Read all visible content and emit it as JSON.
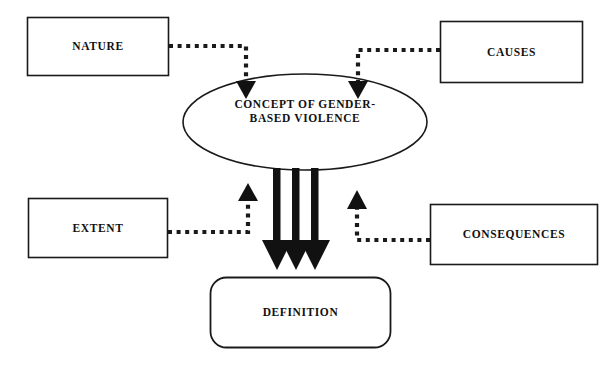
{
  "diagram": {
    "background_color": "#ffffff",
    "line_color": "#1a1a1a",
    "fill_color": "#ffffff",
    "nodes": [
      {
        "id": "nature",
        "label": "NATURE",
        "shape": "rectangle",
        "position": "top-left"
      },
      {
        "id": "causes",
        "label": "CAUSES",
        "shape": "rectangle",
        "position": "top-right"
      },
      {
        "id": "concept",
        "label": "CONCEPT OF GENDER-BASED VIOLENCE",
        "label_line_1": "CONCEPT OF GENDER-",
        "label_line_2": "BASED VIOLENCE",
        "shape": "ellipse",
        "position": "center"
      },
      {
        "id": "extent",
        "label": "EXTENT",
        "shape": "rectangle",
        "position": "middle-left"
      },
      {
        "id": "consequences",
        "label": "CONSEQUENCES",
        "shape": "rectangle",
        "position": "middle-right"
      },
      {
        "id": "definition",
        "label": "DEFINITION",
        "shape": "rounded-rectangle",
        "position": "bottom-center"
      }
    ],
    "connectors": [
      {
        "id": "nature-to-concept",
        "from": "nature",
        "to": "concept",
        "style": "dotted",
        "arrowhead": "solid-triangle-down"
      },
      {
        "id": "causes-to-concept",
        "from": "causes",
        "to": "concept",
        "style": "dotted",
        "arrowhead": "solid-triangle-down"
      },
      {
        "id": "extent-to-concept",
        "from": "extent",
        "to": "concept",
        "style": "dotted",
        "arrowhead": "solid-triangle-up"
      },
      {
        "id": "consequences-to-concept",
        "from": "consequences",
        "to": "concept",
        "style": "dotted",
        "arrowhead": "solid-triangle-up"
      },
      {
        "id": "concept-to-definition-1",
        "from": "concept",
        "to": "definition",
        "style": "thick-solid",
        "arrowhead": "solid-triangle-down"
      },
      {
        "id": "concept-to-definition-2",
        "from": "concept",
        "to": "definition",
        "style": "thick-solid",
        "arrowhead": "solid-triangle-down"
      },
      {
        "id": "concept-to-definition-3",
        "from": "concept",
        "to": "definition",
        "style": "thick-solid",
        "arrowhead": "solid-triangle-down"
      }
    ]
  }
}
